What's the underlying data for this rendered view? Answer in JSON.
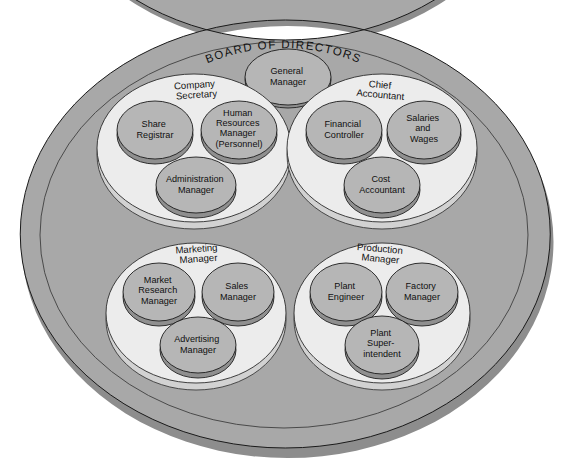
{
  "diagram": {
    "title": "BOARD OF DIRECTORS",
    "colors": {
      "background": "#ffffff",
      "ring_band": "#a8a8a8",
      "ring_shadow": "#8d8d8d",
      "group_disc_face": "#ececec",
      "group_disc_shadow": "#d2d2d2",
      "node_disc_face": "#b6b6b6",
      "node_disc_shadow": "#8f8f8f",
      "outline": "#1a1a1a",
      "text": "#111111"
    },
    "top_node": {
      "label": "General Manager",
      "lines": [
        "General",
        "Manager"
      ]
    },
    "groups": [
      {
        "id": "company-secretary",
        "label": "Company Secretary",
        "label_lines": [
          "Company",
          "Secretary"
        ],
        "members": [
          {
            "id": "share-registrar",
            "label": "Share Registrar",
            "lines": [
              "Share",
              "Registrar"
            ]
          },
          {
            "id": "human-resources-manager",
            "label": "Human Resources Manager (Personnel)",
            "lines": [
              "Human",
              "Resources",
              "Manager",
              "(Personnel)"
            ]
          },
          {
            "id": "administration-manager",
            "label": "Administration Manager",
            "lines": [
              "Administration",
              "Manager"
            ]
          }
        ]
      },
      {
        "id": "chief-accountant",
        "label": "Chief Accountant",
        "label_lines": [
          "Chief",
          "Accountant"
        ],
        "members": [
          {
            "id": "financial-controller",
            "label": "Financial Controller",
            "lines": [
              "Financial",
              "Controller"
            ]
          },
          {
            "id": "salaries-and-wages",
            "label": "Salaries and Wages",
            "lines": [
              "Salaries",
              "and",
              "Wages"
            ]
          },
          {
            "id": "cost-accountant",
            "label": "Cost Accountant",
            "lines": [
              "Cost",
              "Accountant"
            ]
          }
        ]
      },
      {
        "id": "marketing-manager",
        "label": "Marketing Manager",
        "label_lines": [
          "Marketing",
          "Manager"
        ],
        "members": [
          {
            "id": "market-research-manager",
            "label": "Market Research Manager",
            "lines": [
              "Market",
              "Research",
              "Manager"
            ]
          },
          {
            "id": "sales-manager",
            "label": "Sales Manager",
            "lines": [
              "Sales",
              "Manager"
            ]
          },
          {
            "id": "advertising-manager",
            "label": "Advertising Manager",
            "lines": [
              "Advertising",
              "Manager"
            ]
          }
        ]
      },
      {
        "id": "production-manager",
        "label": "Production Manager",
        "label_lines": [
          "Production",
          "Manager"
        ],
        "members": [
          {
            "id": "plant-engineer",
            "label": "Plant Engineer",
            "lines": [
              "Plant",
              "Engineer"
            ]
          },
          {
            "id": "factory-manager",
            "label": "Factory Manager",
            "lines": [
              "Factory",
              "Manager"
            ]
          },
          {
            "id": "plant-superintendent",
            "label": "Plant Superintendent",
            "lines": [
              "Plant",
              "Super-",
              "intendent"
            ]
          }
        ]
      }
    ]
  }
}
